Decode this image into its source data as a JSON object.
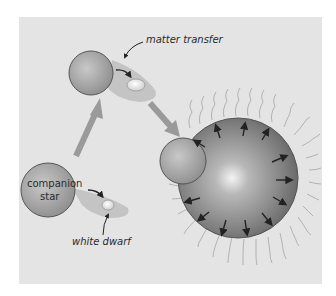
{
  "diagram": {
    "title": "",
    "labels": {
      "matter_transfer": "matter transfer",
      "companion_star_line1": "companion",
      "companion_star_line2": "star",
      "white_dwarf": "white dwarf"
    },
    "stages": [
      {
        "id": "stage-1",
        "description": "companion star with white dwarf"
      },
      {
        "id": "stage-2",
        "description": "matter transfer onto white dwarf"
      },
      {
        "id": "stage-3",
        "description": "nova explosion with outward arrows"
      }
    ],
    "colors": {
      "panel_background": "#e4e4e4",
      "star_fill": "#a8a8a8",
      "star_stroke": "#555555",
      "arrow_gray": "#9a9a9a",
      "accretion_disk": "#c4c4c4",
      "text": "#2a2a2a"
    }
  }
}
